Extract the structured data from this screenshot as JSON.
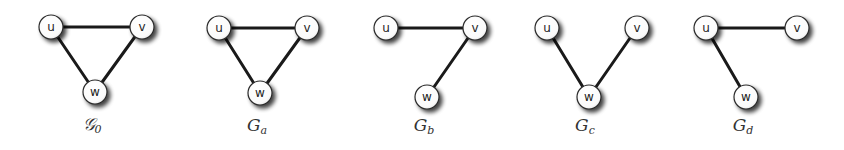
{
  "style": {
    "edge_color": "#1a1a1a",
    "node_fill": "#ffffff",
    "node_stroke": "#2a2a2a",
    "shadow_color": "#555555"
  },
  "graphs": [
    {
      "id": "g0",
      "label_main": "𝒢",
      "label_sub": "0",
      "nodes": [
        {
          "name": "u",
          "x": 51,
          "y": 27
        },
        {
          "name": "v",
          "x": 142,
          "y": 27
        },
        {
          "name": "w",
          "x": 95,
          "y": 92
        }
      ],
      "edges": [
        [
          "u",
          "v"
        ],
        [
          "u",
          "w"
        ],
        [
          "v",
          "w"
        ]
      ],
      "label_x": 92,
      "label_y": 130
    },
    {
      "id": "ga",
      "label_main": "G",
      "label_sub": "a",
      "nodes": [
        {
          "name": "u",
          "x": 219,
          "y": 28
        },
        {
          "name": "v",
          "x": 307,
          "y": 28
        },
        {
          "name": "w",
          "x": 260,
          "y": 93
        }
      ],
      "edges": [
        [
          "u",
          "v"
        ],
        [
          "u",
          "w"
        ],
        [
          "v",
          "w"
        ]
      ],
      "label_x": 257,
      "label_y": 131
    },
    {
      "id": "gb",
      "label_main": "G",
      "label_sub": "b",
      "nodes": [
        {
          "name": "u",
          "x": 386,
          "y": 28
        },
        {
          "name": "v",
          "x": 475,
          "y": 28
        },
        {
          "name": "w",
          "x": 427,
          "y": 97
        }
      ],
      "edges": [
        [
          "u",
          "v"
        ],
        [
          "v",
          "w"
        ]
      ],
      "label_x": 424,
      "label_y": 131
    },
    {
      "id": "gc",
      "label_main": "G",
      "label_sub": "c",
      "nodes": [
        {
          "name": "u",
          "x": 547,
          "y": 28
        },
        {
          "name": "v",
          "x": 637,
          "y": 28
        },
        {
          "name": "w",
          "x": 589,
          "y": 97
        }
      ],
      "edges": [
        [
          "u",
          "w"
        ],
        [
          "v",
          "w"
        ]
      ],
      "label_x": 585,
      "label_y": 131
    },
    {
      "id": "gd",
      "label_main": "G",
      "label_sub": "d",
      "nodes": [
        {
          "name": "u",
          "x": 706,
          "y": 28
        },
        {
          "name": "v",
          "x": 797,
          "y": 28
        },
        {
          "name": "w",
          "x": 746,
          "y": 97
        }
      ],
      "edges": [
        [
          "u",
          "v"
        ],
        [
          "u",
          "w"
        ]
      ],
      "label_x": 743,
      "label_y": 131
    }
  ]
}
